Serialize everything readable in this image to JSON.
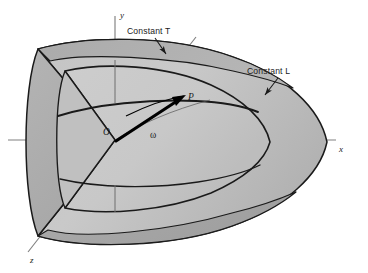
{
  "figure": {
    "type": "3d-schematic-diagram",
    "colors": {
      "background": "#ffffff",
      "shell_fill_light": "#c9c9c9",
      "shell_fill_mid": "#b9b9b9",
      "shell_fill_dark": "#a8a8a8",
      "shell_fill_top_band": "#b0b0b0",
      "outline": "#1a1a1a",
      "axis_line": "#7a7a7a",
      "vector": "#000000",
      "label_text": "#1a1a1a"
    },
    "annotations": [
      {
        "name": "constant-t",
        "label": "Constant T",
        "arrow": "points down-right to inner surface edge"
      },
      {
        "name": "constant-l",
        "label": "Constant L",
        "arrow": "points down-left to outer surface edge"
      }
    ],
    "axes": [
      {
        "name": "y-axis",
        "label": "y",
        "direction": "vertical-up"
      },
      {
        "name": "x-axis",
        "label": "x",
        "direction": "horizontal-right"
      },
      {
        "name": "z-axis",
        "label": "z",
        "direction": "diagonal-lower-left"
      }
    ],
    "points": [
      {
        "name": "origin",
        "label": "O"
      },
      {
        "name": "point-p",
        "label": "P"
      }
    ],
    "vector": {
      "name": "omega-vector",
      "label": "ω",
      "from": "O",
      "to": "P"
    }
  }
}
